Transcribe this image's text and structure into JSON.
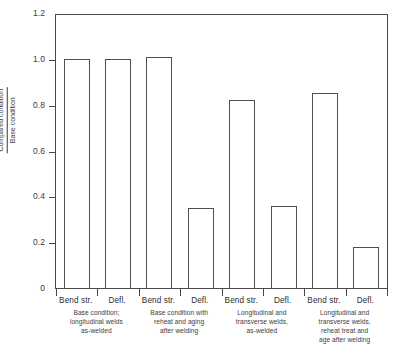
{
  "chart_data": {
    "type": "bar",
    "title": "",
    "xlabel": "",
    "ylabel": "Compared condition / Base condition",
    "ylabel_numerator": "Compared condition",
    "ylabel_denominator": "Base condition",
    "ylim": [
      0,
      1.2
    ],
    "ytick_labels": [
      "1.2",
      "1.0",
      "0.8",
      "0.6",
      "0.4",
      "0.2",
      "0"
    ],
    "ytick_values": [
      1.2,
      1.0,
      0.8,
      0.6,
      0.4,
      0.2,
      0
    ],
    "grid": false,
    "legend": "none",
    "bar_style": "unfilled-outline",
    "categories": [
      "Bend str.",
      "Defl.",
      "Bend str.",
      "Defl.",
      "Bend str.",
      "Defl.",
      "Bend str.",
      "Defl."
    ],
    "values": [
      1.0,
      1.0,
      1.01,
      0.35,
      0.82,
      0.36,
      0.85,
      0.18
    ],
    "groups": [
      {
        "caption": "Base condition; longitudinal welds as-welded",
        "caption_lines": [
          "Base condition;",
          "longitudinal welds",
          "as-welded"
        ],
        "bars": [
          {
            "label": "Bend str.",
            "value": 1.0
          },
          {
            "label": "Defl.",
            "value": 1.0
          }
        ]
      },
      {
        "caption": "Base condition with reheat and aging after welding",
        "caption_lines": [
          "Base condition with",
          "reheat and aging",
          "after welding"
        ],
        "bars": [
          {
            "label": "Bend str.",
            "value": 1.01
          },
          {
            "label": "Defl.",
            "value": 0.35
          }
        ]
      },
      {
        "caption": "Longitudinal and transverse welds, as-welded",
        "caption_lines": [
          "Longitudinal and",
          "transverse welds,",
          "as-welded"
        ],
        "bars": [
          {
            "label": "Bend str.",
            "value": 0.82
          },
          {
            "label": "Defl.",
            "value": 0.36
          }
        ]
      },
      {
        "caption": "Longitudinal and transverse welds, reheat treat and age after welding",
        "caption_lines": [
          "Longitudinal and",
          "transverse welds,",
          "reheat treat and",
          "age after welding"
        ],
        "bars": [
          {
            "label": "Bend str.",
            "value": 0.85
          },
          {
            "label": "Defl.",
            "value": 0.18
          }
        ]
      }
    ],
    "colors": {
      "bar_outline": "#4f4f4f",
      "bar_fill": "#ffffff",
      "axis": "#4a4a4a",
      "text": "#2e2e2e",
      "background": "#ffffff"
    }
  }
}
